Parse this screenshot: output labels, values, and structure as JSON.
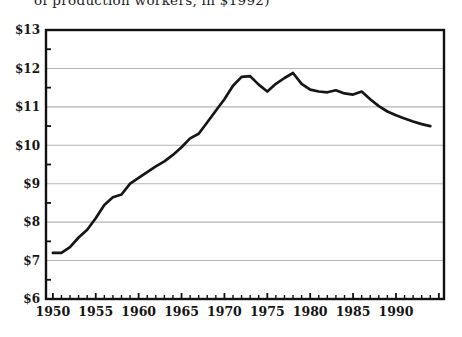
{
  "caption_fragment": "of production workers, in $1992)",
  "colors": {
    "line": "#161616",
    "frame": "#111111",
    "grid": "#b4b4b4",
    "text": "#141414",
    "background": "#ffffff"
  },
  "chart_data": {
    "type": "line",
    "title": "of production workers, in $1992)",
    "xlabel": "",
    "ylabel": "",
    "legend": "none",
    "grid": "horizontal-only",
    "xlim": [
      1949.2,
      1995.6
    ],
    "ylim": [
      6,
      13
    ],
    "y_gridline_values": [
      7,
      8,
      9,
      10,
      11,
      12
    ],
    "y_tick_labels": [
      {
        "value": 13,
        "label": "$13"
      },
      {
        "value": 12,
        "label": "$12"
      },
      {
        "value": 11,
        "label": "$11"
      },
      {
        "value": 10,
        "label": "$10"
      },
      {
        "value": 9,
        "label": "$9"
      },
      {
        "value": 8,
        "label": "$8"
      },
      {
        "value": 7,
        "label": "$7"
      },
      {
        "value": 6,
        "label": "$6"
      }
    ],
    "y_minor_tick_values": [
      6.5,
      7.5,
      8.5,
      9.5,
      10.5,
      11.5,
      12.5
    ],
    "x_tick_labels": [
      {
        "value": 1950,
        "label": "1950"
      },
      {
        "value": 1955,
        "label": "1955"
      },
      {
        "value": 1960,
        "label": "1960"
      },
      {
        "value": 1965,
        "label": "1965"
      },
      {
        "value": 1970,
        "label": "1970"
      },
      {
        "value": 1975,
        "label": "1975"
      },
      {
        "value": 1980,
        "label": "1980"
      },
      {
        "value": 1985,
        "label": "1985"
      },
      {
        "value": 1990,
        "label": "1990"
      }
    ],
    "x_minor_tick_range": [
      1950,
      1995
    ],
    "series": [
      {
        "name": "real-average-hourly-earnings-1992-dollars",
        "x": [
          1950,
          1951,
          1952,
          1953,
          1954,
          1955,
          1956,
          1957,
          1958,
          1959,
          1960,
          1961,
          1962,
          1963,
          1964,
          1965,
          1966,
          1967,
          1968,
          1969,
          1970,
          1971,
          1972,
          1973,
          1974,
          1975,
          1976,
          1977,
          1978,
          1979,
          1980,
          1981,
          1982,
          1983,
          1984,
          1985,
          1986,
          1987,
          1988,
          1989,
          1990,
          1991,
          1992,
          1993,
          1994
        ],
        "values": [
          7.2,
          7.2,
          7.35,
          7.6,
          7.8,
          8.1,
          8.45,
          8.65,
          8.72,
          9.0,
          9.15,
          9.3,
          9.45,
          9.58,
          9.75,
          9.95,
          10.18,
          10.3,
          10.6,
          10.9,
          11.2,
          11.55,
          11.78,
          11.8,
          11.58,
          11.4,
          11.6,
          11.75,
          11.88,
          11.6,
          11.45,
          11.4,
          11.38,
          11.43,
          11.35,
          11.32,
          11.4,
          11.2,
          11.02,
          10.88,
          10.78,
          10.7,
          10.62,
          10.55,
          10.5
        ]
      }
    ]
  }
}
